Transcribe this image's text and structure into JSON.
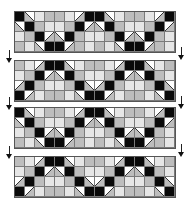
{
  "figure": {
    "colors": {
      "black": "#0a0a0a",
      "light": "#e6e6e6",
      "gray": "#bdbdbd",
      "white": "#ffffff",
      "grid_line": "#7a7a7a"
    },
    "legend_codes": {
      "B": "black cell",
      "L": "light gray cell",
      "G": "medium gray cell",
      "D1": "diagonal split cell (\\), white upper-right",
      "D2": "diagonal split cell (/), white upper-left"
    },
    "panels": [
      {
        "id": "panel-1",
        "top": 12,
        "rows": [
          [
            "B",
            "D1",
            "L",
            "G",
            "G",
            "L",
            "D2",
            "B",
            "B",
            "D1",
            "L",
            "G",
            "G",
            "L",
            "D2",
            "B"
          ],
          [
            "D1",
            "B",
            "G",
            "L",
            "L",
            "G",
            "B",
            "D2",
            "D1",
            "B",
            "G",
            "L",
            "L",
            "G",
            "B",
            "D2"
          ],
          [
            "L",
            "G",
            "B",
            "D2",
            "D1",
            "B",
            "G",
            "L",
            "L",
            "G",
            "B",
            "D2",
            "D1",
            "B",
            "G",
            "L"
          ],
          [
            "G",
            "L",
            "D1",
            "B",
            "B",
            "D2",
            "G",
            "L",
            "G",
            "L",
            "D1",
            "B",
            "B",
            "D2",
            "G",
            "L"
          ]
        ]
      },
      {
        "id": "panel-2",
        "top": 61,
        "rows": [
          [
            "G",
            "L",
            "D2",
            "B",
            "B",
            "D1",
            "L",
            "G",
            "G",
            "L",
            "D2",
            "B",
            "B",
            "D1",
            "L",
            "G"
          ],
          [
            "L",
            "G",
            "B",
            "D2",
            "D1",
            "B",
            "G",
            "L",
            "L",
            "G",
            "B",
            "D2",
            "D1",
            "B",
            "G",
            "L"
          ],
          [
            "D2",
            "B",
            "G",
            "L",
            "L",
            "G",
            "B",
            "D1",
            "D2",
            "B",
            "G",
            "L",
            "L",
            "G",
            "B",
            "D1"
          ],
          [
            "B",
            "D2",
            "L",
            "G",
            "G",
            "L",
            "D1",
            "B",
            "B",
            "D2",
            "L",
            "G",
            "G",
            "L",
            "D1",
            "B"
          ]
        ]
      },
      {
        "id": "panel-3",
        "top": 108,
        "rows": [
          [
            "B",
            "D1",
            "L",
            "G",
            "G",
            "L",
            "D2",
            "B",
            "B",
            "D1",
            "L",
            "G",
            "G",
            "L",
            "D2",
            "B"
          ],
          [
            "D1",
            "B",
            "G",
            "L",
            "L",
            "G",
            "B",
            "D2",
            "D1",
            "B",
            "G",
            "L",
            "L",
            "G",
            "B",
            "D2"
          ],
          [
            "L",
            "G",
            "B",
            "D2",
            "D1",
            "B",
            "G",
            "L",
            "L",
            "G",
            "B",
            "D2",
            "D1",
            "B",
            "G",
            "L"
          ],
          [
            "G",
            "L",
            "D1",
            "B",
            "B",
            "D2",
            "G",
            "L",
            "G",
            "L",
            "D1",
            "B",
            "B",
            "D2",
            "G",
            "L"
          ]
        ]
      },
      {
        "id": "panel-4",
        "top": 157,
        "rows": [
          [
            "G",
            "L",
            "D2",
            "B",
            "B",
            "D1",
            "L",
            "G",
            "G",
            "L",
            "D2",
            "B",
            "B",
            "D1",
            "L",
            "G"
          ],
          [
            "L",
            "G",
            "B",
            "D2",
            "D1",
            "B",
            "G",
            "L",
            "L",
            "G",
            "B",
            "D2",
            "D1",
            "B",
            "G",
            "L"
          ],
          [
            "D2",
            "B",
            "G",
            "L",
            "L",
            "G",
            "B",
            "D1",
            "D2",
            "B",
            "G",
            "L",
            "L",
            "G",
            "B",
            "D1"
          ],
          [
            "B",
            "D2",
            "L",
            "G",
            "G",
            "L",
            "D1",
            "B",
            "B",
            "D2",
            "L",
            "G",
            "G",
            "L",
            "D1",
            "B"
          ]
        ]
      }
    ],
    "arrows": [
      {
        "side": "left",
        "x": 6,
        "y": 50,
        "icon": "down-arrow-icon"
      },
      {
        "side": "right",
        "x": 178,
        "y": 47,
        "icon": "down-arrow-icon"
      },
      {
        "side": "left",
        "x": 6,
        "y": 97,
        "icon": "down-arrow-icon"
      },
      {
        "side": "right",
        "x": 178,
        "y": 96,
        "icon": "down-arrow-icon"
      },
      {
        "side": "left",
        "x": 6,
        "y": 146,
        "icon": "down-arrow-icon"
      },
      {
        "side": "right",
        "x": 178,
        "y": 144,
        "icon": "down-arrow-icon"
      }
    ]
  }
}
